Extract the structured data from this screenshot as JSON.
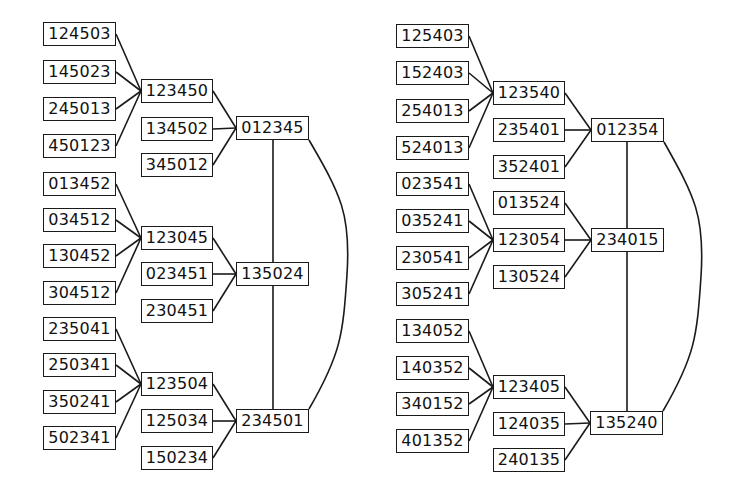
{
  "graphs": [
    {
      "id": "left",
      "hubs": [
        {
          "label": "012345",
          "x": 236,
          "y": 116
        },
        {
          "label": "135024",
          "x": 236,
          "y": 262
        },
        {
          "label": "234501",
          "x": 236,
          "y": 409
        }
      ],
      "mids": [
        {
          "label": "123450",
          "x": 141,
          "y": 79,
          "hub": 0
        },
        {
          "label": "134502",
          "x": 141,
          "y": 117,
          "hub": 0
        },
        {
          "label": "345012",
          "x": 141,
          "y": 153,
          "hub": 0
        },
        {
          "label": "123045",
          "x": 141,
          "y": 226,
          "hub": 1
        },
        {
          "label": "023451",
          "x": 141,
          "y": 262,
          "hub": 1
        },
        {
          "label": "230451",
          "x": 141,
          "y": 299,
          "hub": 1
        },
        {
          "label": "123504",
          "x": 141,
          "y": 372,
          "hub": 2
        },
        {
          "label": "125034",
          "x": 141,
          "y": 409,
          "hub": 2
        },
        {
          "label": "150234",
          "x": 141,
          "y": 446,
          "hub": 2
        }
      ],
      "leaves": [
        {
          "label": "124503",
          "x": 43,
          "y": 22,
          "mid": 0
        },
        {
          "label": "145023",
          "x": 43,
          "y": 60,
          "mid": 0
        },
        {
          "label": "245013",
          "x": 43,
          "y": 97,
          "mid": 0
        },
        {
          "label": "450123",
          "x": 43,
          "y": 134,
          "mid": 0
        },
        {
          "label": "013452",
          "x": 43,
          "y": 172,
          "mid": 3
        },
        {
          "label": "034512",
          "x": 43,
          "y": 208,
          "mid": 3
        },
        {
          "label": "130452",
          "x": 43,
          "y": 244,
          "mid": 3
        },
        {
          "label": "304512",
          "x": 43,
          "y": 281,
          "mid": 3
        },
        {
          "label": "235041",
          "x": 43,
          "y": 317,
          "mid": 6
        },
        {
          "label": "250341",
          "x": 43,
          "y": 353,
          "mid": 6
        },
        {
          "label": "350241",
          "x": 43,
          "y": 390,
          "mid": 6
        },
        {
          "label": "502341",
          "x": 43,
          "y": 426,
          "mid": 6
        }
      ],
      "spine_x": 273,
      "arc": {
        "from_hub": 0,
        "to_hub": 2,
        "bulge_x": 347
      }
    },
    {
      "id": "right",
      "hubs": [
        {
          "label": "012354",
          "x": 591,
          "y": 118
        },
        {
          "label": "234015",
          "x": 591,
          "y": 228
        },
        {
          "label": "135240",
          "x": 590,
          "y": 411
        }
      ],
      "mids": [
        {
          "label": "123540",
          "x": 493,
          "y": 81,
          "hub": 0
        },
        {
          "label": "235401",
          "x": 493,
          "y": 118,
          "hub": 0
        },
        {
          "label": "352401",
          "x": 493,
          "y": 155,
          "hub": 0
        },
        {
          "label": "013524",
          "x": 493,
          "y": 191,
          "hub": 1
        },
        {
          "label": "123054",
          "x": 493,
          "y": 228,
          "hub": 1
        },
        {
          "label": "130524",
          "x": 493,
          "y": 265,
          "hub": 1
        },
        {
          "label": "123405",
          "x": 493,
          "y": 375,
          "hub": 2
        },
        {
          "label": "124035",
          "x": 493,
          "y": 412,
          "hub": 2
        },
        {
          "label": "240135",
          "x": 493,
          "y": 448,
          "hub": 2
        }
      ],
      "leaves": [
        {
          "label": "125403",
          "x": 396,
          "y": 24,
          "mid": 0
        },
        {
          "label": "152403",
          "x": 396,
          "y": 61,
          "mid": 0
        },
        {
          "label": "254013",
          "x": 396,
          "y": 99,
          "mid": 0
        },
        {
          "label": "524013",
          "x": 396,
          "y": 136,
          "mid": 0
        },
        {
          "label": "023541",
          "x": 396,
          "y": 172,
          "mid": 4
        },
        {
          "label": "035241",
          "x": 396,
          "y": 209,
          "mid": 4
        },
        {
          "label": "230541",
          "x": 396,
          "y": 246,
          "mid": 4
        },
        {
          "label": "305241",
          "x": 396,
          "y": 282,
          "mid": 4
        },
        {
          "label": "134052",
          "x": 396,
          "y": 319,
          "mid": 6
        },
        {
          "label": "140352",
          "x": 396,
          "y": 356,
          "mid": 6
        },
        {
          "label": "340152",
          "x": 396,
          "y": 392,
          "mid": 6
        },
        {
          "label": "401352",
          "x": 396,
          "y": 429,
          "mid": 6
        }
      ],
      "spine_x": 627,
      "arc": {
        "from_hub": 0,
        "to_hub": 2,
        "bulge_x": 701
      }
    }
  ],
  "style": {
    "stroke_color": "#1a1a1a",
    "box_fill": "#ffffff",
    "text_color": "#111111",
    "background": "#ffffff"
  }
}
